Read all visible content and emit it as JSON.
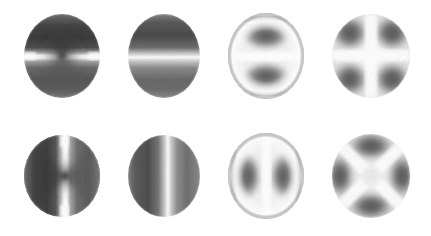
{
  "figure": {
    "background_color": "#ffffff",
    "width": 431,
    "height": 236,
    "rows": 2,
    "columns": 4,
    "colormap": "grayscale",
    "dark_color": "#3a3a3a",
    "mid_color": "#8f8f8f",
    "bright_color": "#ffffff"
  },
  "panels": [
    {
      "id": "panel-1",
      "row": 1,
      "column": 1,
      "pattern": "horizontal-bright-band-with-central-cusp",
      "symmetry": "2-fold",
      "orientation_deg": 0,
      "node_lines": 1,
      "cx": 62,
      "cy": 56,
      "rx": 38,
      "ry": 42,
      "has_bright_rim": false,
      "has_radial_node": false,
      "bright_axis": "horizontal",
      "center_value": "dark-cusp"
    },
    {
      "id": "panel-2",
      "row": 1,
      "column": 2,
      "pattern": "horizontal-bright-band-uniform",
      "symmetry": "mirror",
      "orientation_deg": 0,
      "node_lines": 1,
      "cx": 164,
      "cy": 56,
      "rx": 36,
      "ry": 42,
      "has_bright_rim": false,
      "has_radial_node": false,
      "bright_axis": "horizontal",
      "center_value": "bright"
    },
    {
      "id": "panel-3",
      "row": 1,
      "column": 3,
      "pattern": "horizontal-band-with-bright-rim",
      "symmetry": "2-fold",
      "orientation_deg": 0,
      "node_lines": 1,
      "cx": 266,
      "cy": 56,
      "rx": 38,
      "ry": 43,
      "has_bright_rim": true,
      "has_radial_node": true,
      "bright_axis": "horizontal",
      "center_value": "bright"
    },
    {
      "id": "panel-4",
      "row": 1,
      "column": 4,
      "pattern": "bright-plus-cross",
      "symmetry": "4-fold",
      "orientation_deg": 0,
      "node_lines": 2,
      "cx": 371,
      "cy": 56,
      "rx": 39,
      "ry": 42,
      "has_bright_rim": false,
      "has_radial_node": false,
      "bright_axis": "horizontal-and-vertical",
      "center_value": "bright"
    },
    {
      "id": "panel-5",
      "row": 2,
      "column": 1,
      "pattern": "vertical-bright-band-with-central-cusp",
      "symmetry": "2-fold",
      "orientation_deg": 90,
      "node_lines": 1,
      "cx": 62,
      "cy": 176,
      "rx": 38,
      "ry": 41,
      "has_bright_rim": false,
      "has_radial_node": false,
      "bright_axis": "vertical",
      "center_value": "dark-cusp"
    },
    {
      "id": "panel-6",
      "row": 2,
      "column": 2,
      "pattern": "vertical-bright-band-uniform",
      "symmetry": "mirror",
      "orientation_deg": 90,
      "node_lines": 1,
      "cx": 164,
      "cy": 176,
      "rx": 36,
      "ry": 41,
      "has_bright_rim": false,
      "has_radial_node": false,
      "bright_axis": "vertical",
      "center_value": "bright"
    },
    {
      "id": "panel-7",
      "row": 2,
      "column": 3,
      "pattern": "vertical-band-with-bright-rim",
      "symmetry": "2-fold",
      "orientation_deg": 90,
      "node_lines": 1,
      "cx": 266,
      "cy": 176,
      "rx": 38,
      "ry": 43,
      "has_bright_rim": true,
      "has_radial_node": true,
      "bright_axis": "vertical",
      "center_value": "bright"
    },
    {
      "id": "panel-8",
      "row": 2,
      "column": 4,
      "pattern": "bright-diagonal-cross",
      "symmetry": "4-fold",
      "orientation_deg": 45,
      "node_lines": 2,
      "cx": 371,
      "cy": 176,
      "rx": 39,
      "ry": 42,
      "has_bright_rim": false,
      "has_radial_node": false,
      "bright_axis": "diagonal",
      "center_value": "mid"
    }
  ]
}
